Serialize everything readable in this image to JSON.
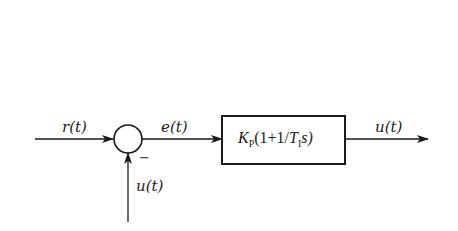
{
  "diagram": {
    "type": "block-diagram",
    "signals": {
      "reference": "r(t)",
      "error": "e(t)",
      "output": "u(t)",
      "feedback": "u(t)"
    },
    "summing_junction": {
      "feedback_sign": "−"
    },
    "controller_block": {
      "gain": "K",
      "gain_subscript": "P",
      "expr_open": "(1+1/",
      "time_const": "T",
      "time_const_subscript": "I",
      "expr_close": "s)"
    },
    "colors": {
      "stroke": "#1a1a1a",
      "background": "#ffffff"
    }
  }
}
